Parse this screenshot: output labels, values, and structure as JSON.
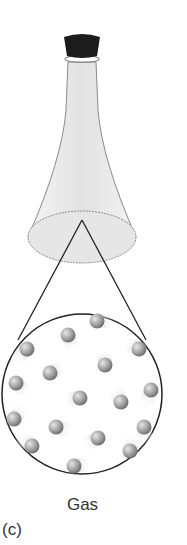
{
  "figure": {
    "caption_label": "Gas",
    "part_label": "(c)"
  },
  "colors": {
    "stopper": "#1a1a1a",
    "flask_fill": "#e8e8e8",
    "flask_outline": "#888888",
    "circle_outline": "#222222",
    "molecule": "#9a9a9a"
  },
  "molecules": [
    {
      "x": 97,
      "y": 321
    },
    {
      "x": 68,
      "y": 335
    },
    {
      "x": 27,
      "y": 349
    },
    {
      "x": 139,
      "y": 349
    },
    {
      "x": 105,
      "y": 365
    },
    {
      "x": 50,
      "y": 373
    },
    {
      "x": 16,
      "y": 383
    },
    {
      "x": 151,
      "y": 390
    },
    {
      "x": 80,
      "y": 398
    },
    {
      "x": 121,
      "y": 402
    },
    {
      "x": 14,
      "y": 419
    },
    {
      "x": 56,
      "y": 427
    },
    {
      "x": 144,
      "y": 427
    },
    {
      "x": 98,
      "y": 438
    },
    {
      "x": 32,
      "y": 446
    },
    {
      "x": 130,
      "y": 451
    },
    {
      "x": 74,
      "y": 466
    }
  ]
}
